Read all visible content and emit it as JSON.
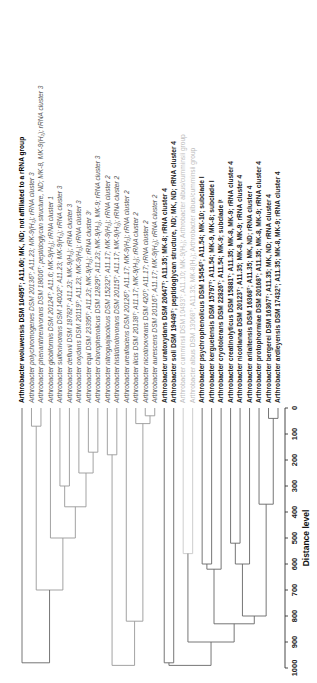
{
  "chart_data": {
    "type": "dendrogram",
    "title": "",
    "xlabel": "Distance level",
    "axis": {
      "ticks": [
        0,
        100,
        200,
        300,
        400,
        500,
        600,
        700,
        800,
        900,
        1000
      ],
      "range": [
        0,
        1000
      ]
    },
    "leaves": [
      {
        "label": "Arthrobacter woluwensis DSM 10495ᵀ; A11.60; MK, ND; not affiliated to a rRNA group",
        "style": "bold"
      },
      {
        "label": "Arthrobacter polychromogenes DSM 20136ᵀ; A11.23; MK-9(H₂); rRNA cluster 3",
        "style": "normal"
      },
      {
        "label": "Arthrobacter phenanthrenivorans DSM 18606ᵀ; peptidoglycan structure, ND; MK-8, MK-9(H₂); rRNA cluster 3",
        "style": "normal"
      },
      {
        "label": "Arthrobacter globiformis DSM 20124ᵀ; A11.6; MK-9(H₂); rRNA cluster 1",
        "style": "normal"
      },
      {
        "label": "Arthrobacter sulfonivorans DSM 14002ᵀ; A11.23; MK-9(H₂); rRNA cluster 3",
        "style": "normal"
      },
      {
        "label": "Arthrobacter defluvii DSM 18782ᵀ; A11.23; MK-9(H₂); rRNA cluster 3",
        "style": "normal"
      },
      {
        "label": "Arthrobacter oxydans DSM 20119ᵀ; A11.23; MK-9(H₂); rRNA cluster 3",
        "style": "normal"
      },
      {
        "label": "Arthrobacter equi DSM 23395ᵀ; A11.23; MK-9(H₂); rRNA cluster 3ᵗ",
        "style": "normal"
      },
      {
        "label": "Arthrobacter chlorophenolicus DSM 12829ᵀ; A11.23; MK-9(H₂), MK-9; rRNA cluster 3",
        "style": "normal"
      },
      {
        "label": "Arthrobacter nitroguajacolicus DSM 15232ᵀ; A11.17; MK-9(H₂); rRNA cluster 2",
        "style": "normal"
      },
      {
        "label": "Arthrobacter histidinolovorans DSM 20115ᵀ; A11.17; MK-9(H₂); rRNA cluster 2",
        "style": "normal"
      },
      {
        "label": "Arthrobacter ureafaciens DSM 20126ᵀ; A11.17; MK-9(H₂); rRNA cluster 2",
        "style": "normal"
      },
      {
        "label": "Arthrobacter ilicis DSM 20138ᵀ; A11.17; MK-9(H₂); rRNA cluster 2",
        "style": "normal"
      },
      {
        "label": "Arthrobacter nicotinovorans DSM 420ᵀ; A11.17; rRNA cluster 2",
        "style": "normal"
      },
      {
        "label": "Arthrobacter aurescens DSM 20116ᵀ; A11.17; MK-9(H₂); rRNA cluster 2",
        "style": "normal"
      },
      {
        "label": "Arthrobacter uratoxydans DSM 20647ᵀ; A11.35; MK-8; rRNA cluster 4",
        "style": "semibold"
      },
      {
        "label": "Arthrobacter soli DSM 19449ᵀ; peptidoglycan structure, ND; MK, ND; rRNA cluster 4",
        "style": "semibold"
      },
      {
        "label": "Arthrobacter cumminsii DSM 10493ᵀ; A11.10; MK-9(H₂); Arthrobacter albus/cumminsii group",
        "style": "faint"
      },
      {
        "label": "Arthrobacter albus DSM 13068ᵀ; A11.35; MK-8(H₂); Arthrobacter albus/cumminsii group",
        "style": "faint"
      },
      {
        "label": "Arthrobacter psychrophenolicus DSM 15454ᵀ; A11.54; MK-10; subclade I",
        "style": "semibold"
      },
      {
        "label": "Arthrobacter kerguelensis DSM 15797ᵀ; A11.54; MK-9, MK-8; subclade I",
        "style": "semibold"
      },
      {
        "label": "Arthrobacter cryotolerans DSM 22826ᵀ; A11.54; MK-9; subclade Iᵗ",
        "style": "semibold"
      },
      {
        "label": "Arthrobacter creatinolyticus DSM 15881ᵀ; A11.35; MK-8, MK-9; rRNA cluster 4",
        "style": "semibold"
      },
      {
        "label": "Arthrobacter nicotianae DSM 20123ᵀ; A11.35; MK-8, MK-9; rRNA cluster 4",
        "style": "semibold"
      },
      {
        "label": "Arthrobacter arilaitensis DSM 16368ᵀ; A11.35; MK, ND; rRNA cluster 4",
        "style": "semibold"
      },
      {
        "label": "Arthrobacter protophormiae DSM 20168ᵀ; A11.35; MK-8, MK-9; rRNA cluster 4",
        "style": "semibold"
      },
      {
        "label": "Arthrobacter bergerei DSM 16367ᵀ; A11.35; MK, ND; rRNA cluster 4",
        "style": "semibold"
      },
      {
        "label": "Arthrobacter ardleyensis DSM 17432ᵀ; A11.35; MK-8, MK-9; rRNA cluster 4",
        "style": "semibold"
      }
    ]
  }
}
